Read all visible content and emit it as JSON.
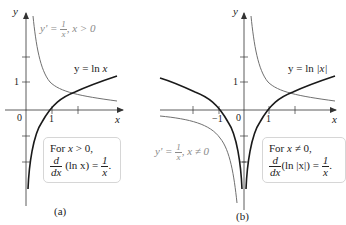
{
  "figure_a": {
    "caption": "(a)",
    "axis_labels": {
      "x": "x",
      "y": "y"
    },
    "tick_labels": {
      "origin": "0",
      "x1": "1",
      "y1": "1"
    },
    "curve_ln": {
      "label_prefix": "y = ln ",
      "label_var": "x"
    },
    "curve_deriv": {
      "label_lhs": "y' = ",
      "num": "1",
      "den": "x",
      "label_cond": ", x > 0"
    },
    "box": {
      "line1_prefix": "For ",
      "line1_var": "x",
      "line1_suffix": " > 0,",
      "d_num": "d",
      "d_den": "dx",
      "expr": " (ln x) = ",
      "rhs_num": "1",
      "rhs_den": "x",
      "end": "."
    }
  },
  "figure_b": {
    "caption": "(b)",
    "axis_labels": {
      "x": "x",
      "y": "y"
    },
    "tick_labels": {
      "origin": "0",
      "x1": "1",
      "xm1": "−1",
      "y1": "1"
    },
    "curve_ln": {
      "label_prefix": "y = ln ",
      "label_var": "|x|"
    },
    "curve_deriv": {
      "label_lhs": "y' = ",
      "num": "1",
      "den": "x",
      "label_cond": ", x ≠ 0"
    },
    "box": {
      "line1_prefix": "For ",
      "line1_var": "x",
      "line1_suffix": " ≠ 0,",
      "d_num": "d",
      "d_den": "dx",
      "expr": "(ln |x|) = ",
      "rhs_num": "1",
      "rhs_den": "x",
      "end": "."
    }
  },
  "colors": {
    "ln_curve": "#1a1a1a",
    "deriv_curve": "#707070",
    "axis": "#333333",
    "box_border": "#d6d6d6"
  }
}
